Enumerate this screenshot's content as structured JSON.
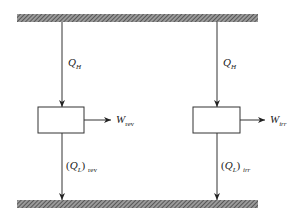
{
  "diagram": {
    "type": "heat engine comparison",
    "reservoirs": {
      "hot": {
        "label": ""
      },
      "cold": {
        "label": ""
      }
    },
    "engines": [
      {
        "id": "reversible",
        "heat_in": {
          "symbol": "Q",
          "subscript": "H"
        },
        "work_out": {
          "symbol": "W",
          "subscript": "rev"
        },
        "heat_out": {
          "prefix": "(",
          "symbol": "Q",
          "subscript": "L",
          "suffix": ")",
          "outer_subscript": "rev"
        }
      },
      {
        "id": "irreversible",
        "heat_in": {
          "symbol": "Q",
          "subscript": "H"
        },
        "work_out": {
          "symbol": "W",
          "subscript": "irr"
        },
        "heat_out": {
          "prefix": "(",
          "symbol": "Q",
          "subscript": "L",
          "suffix": ")",
          "outer_subscript": "irr"
        }
      }
    ],
    "colors": {
      "line": "#333333",
      "hatch": "#555555",
      "background": "#ffffff"
    }
  }
}
